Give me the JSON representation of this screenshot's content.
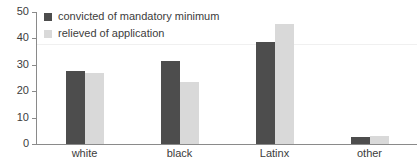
{
  "chart_data": {
    "type": "bar",
    "title": "",
    "subtitle": "",
    "xlabel": "",
    "ylabel": "",
    "categories": [
      "white",
      "black",
      "Latinx",
      "other"
    ],
    "series": [
      {
        "name": "convicted of mandatory minimum",
        "color": "#4d4d4d",
        "values": [
          27.5,
          31.5,
          38.5,
          2.5
        ]
      },
      {
        "name": "relieved of application",
        "color": "#d9d9d9",
        "values": [
          27,
          23.5,
          45.5,
          3
        ]
      }
    ],
    "ylim": [
      0,
      50
    ],
    "yticks": [
      0,
      10,
      20,
      30,
      40,
      50
    ],
    "ytick_labels": [
      "0",
      "10",
      "20",
      "30",
      "40",
      "50"
    ],
    "grid": false,
    "legend_position": "top-left",
    "axis_color": "#8a8a8a"
  }
}
